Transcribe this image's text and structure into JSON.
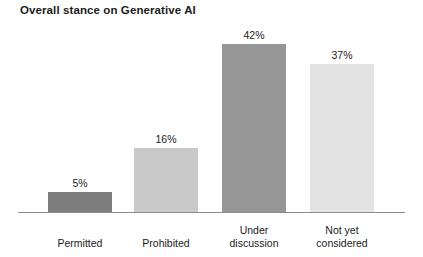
{
  "chart_data": {
    "type": "bar",
    "title": "Overall stance on Generative AI",
    "xlabel": "",
    "ylabel": "",
    "ylim": [
      0,
      50
    ],
    "grid": false,
    "legend": false,
    "value_suffix": "%",
    "categories": [
      "Permitted",
      "Prohibited",
      "Under discussion",
      "Not yet considered"
    ],
    "values": [
      5,
      16,
      42,
      37
    ],
    "value_labels": [
      "5%",
      "16%",
      "42%",
      "37%"
    ],
    "category_lines": [
      [
        "Permitted"
      ],
      [
        "Prohibited"
      ],
      [
        "Under",
        "discussion"
      ],
      [
        "Not yet",
        "considered"
      ]
    ],
    "bar_colors": [
      "#7d7d7d",
      "#c9c9c9",
      "#969696",
      "#e3e3e3"
    ],
    "axis_color": "#8c8c8c",
    "text_color": "#1b1b1b",
    "background": "#ffffff"
  }
}
